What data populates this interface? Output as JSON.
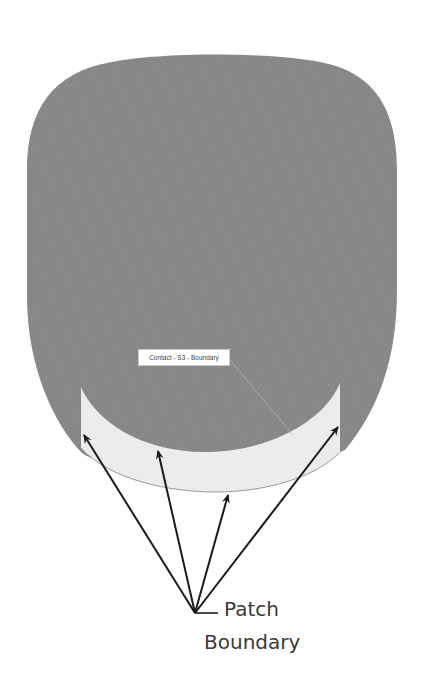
{
  "diagram": {
    "surface": {
      "fill": "#8a8a8a",
      "name": "contact surface"
    },
    "patch": {
      "fill": "#ececec",
      "edge": "#9a9a9a"
    },
    "surface_label": {
      "text": "Contact - S3 - Boundary"
    },
    "callout": {
      "line1": "Patch",
      "line2": "Boundary",
      "arrow_color": "#1a1a1a",
      "arrow_count": 4
    }
  }
}
